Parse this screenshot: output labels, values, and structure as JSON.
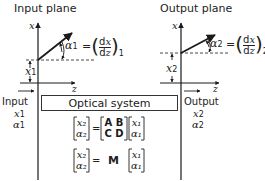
{
  "input_plane": {
    "title": "Input plane",
    "x_axis_label": "x",
    "z_axis_label": "z",
    "height_label": "x",
    "height_sub": "1",
    "angle_label": "α",
    "angle_sub": "1",
    "angle_eq": "= (dx/dz)",
    "angle_eq_sub": "1"
  },
  "output_plane": {
    "title": "Output plane",
    "x_axis_label": "x",
    "z_axis_label": "z",
    "height_label": "x",
    "height_sub": "2",
    "angle_label": "α",
    "angle_sub": "2",
    "angle_eq": "= (dx/dz)",
    "angle_eq_sub": "2"
  },
  "system": {
    "label": "Optical system",
    "input_label": "Input",
    "output_label": "Output",
    "input_vars": [
      "x",
      "1",
      "α",
      "1"
    ],
    "output_vars": [
      "x",
      "2",
      "α",
      "2"
    ]
  },
  "equations": {
    "eq1": {
      "lhs": [
        "x₂",
        "α₂"
      ],
      "equals": "=",
      "matrix": [
        "A B",
        "C D"
      ],
      "rhs": [
        "x₁",
        "α₁"
      ]
    },
    "eq2": {
      "lhs": [
        "x₂",
        "α₂"
      ],
      "equals": "=",
      "matrix_symbol": "M",
      "rhs": [
        "x₁",
        "α₁"
      ]
    }
  },
  "colors": {
    "line": "#1a1a1a",
    "text": "#222222"
  }
}
